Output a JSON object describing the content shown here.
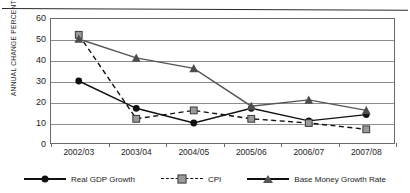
{
  "chart_data": {
    "type": "line",
    "title": "",
    "xlabel": "",
    "ylabel": "ANNUAL CHANGE PERCENT (%)",
    "categories": [
      "2002/03",
      "2003/04",
      "2004/05",
      "2005/06",
      "2006/07",
      "2007/08"
    ],
    "ylim": [
      0,
      60
    ],
    "yticks": [
      0,
      10,
      20,
      30,
      40,
      50,
      60
    ],
    "grid": true,
    "legend_position": "bottom",
    "series": [
      {
        "name": "Real GDP Growth",
        "marker": "circle",
        "linestyle": "solid",
        "color": "#111111",
        "values": [
          30,
          17,
          10,
          17,
          11,
          14
        ]
      },
      {
        "name": "CPI",
        "marker": "square",
        "linestyle": "dashed",
        "color": "#111111",
        "values": [
          52,
          12,
          16,
          12,
          10,
          7
        ]
      },
      {
        "name": "Base Money Growth Rate",
        "marker": "triangle",
        "linestyle": "solid",
        "color": "#555555",
        "values": [
          50,
          41,
          36,
          18,
          21,
          16
        ]
      }
    ]
  },
  "legend": {
    "items": [
      {
        "label": "Real GDP Growth",
        "marker": "circle-marker-icon",
        "style": "solid"
      },
      {
        "label": "CPI",
        "marker": "square-marker-icon",
        "style": "dashed"
      },
      {
        "label": "Base Money Growth Rate",
        "marker": "triangle-marker-icon",
        "style": "solid"
      }
    ]
  }
}
